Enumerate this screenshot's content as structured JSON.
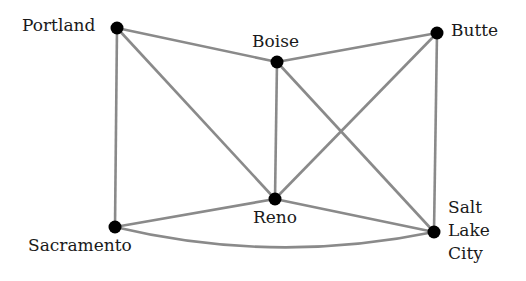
{
  "graph": {
    "edge_color": "#8a8a8a",
    "node_color": "#000000",
    "nodes": [
      {
        "id": "portland",
        "label": "Portland",
        "x": 117,
        "y": 28
      },
      {
        "id": "boise",
        "label": "Boise",
        "x": 277,
        "y": 62
      },
      {
        "id": "butte",
        "label": "Butte",
        "x": 437,
        "y": 33
      },
      {
        "id": "sacramento",
        "label": "Sacramento",
        "x": 115,
        "y": 227
      },
      {
        "id": "reno",
        "label": "Reno",
        "x": 275,
        "y": 199
      },
      {
        "id": "salt_lake_city",
        "label": "Salt\nLake\nCity",
        "x": 434,
        "y": 232
      }
    ],
    "edges": [
      {
        "from": "portland",
        "to": "boise"
      },
      {
        "from": "portland",
        "to": "sacramento"
      },
      {
        "from": "portland",
        "to": "reno"
      },
      {
        "from": "boise",
        "to": "butte"
      },
      {
        "from": "boise",
        "to": "reno"
      },
      {
        "from": "boise",
        "to": "salt_lake_city"
      },
      {
        "from": "butte",
        "to": "reno"
      },
      {
        "from": "butte",
        "to": "salt_lake_city"
      },
      {
        "from": "sacramento",
        "to": "reno"
      },
      {
        "from": "sacramento",
        "to": "salt_lake_city",
        "curved": true
      },
      {
        "from": "reno",
        "to": "salt_lake_city"
      }
    ]
  },
  "labels": {
    "portland": "Portland",
    "boise": "Boise",
    "butte": "Butte",
    "sacramento": "Sacramento",
    "reno": "Reno",
    "salt_lake_city": "Salt\nLake\nCity"
  }
}
